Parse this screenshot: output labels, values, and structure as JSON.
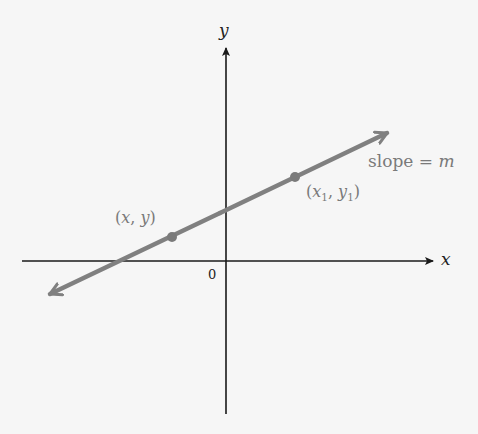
{
  "diagram": {
    "axes": {
      "x_label": "x",
      "y_label": "y",
      "origin_label": "0"
    },
    "line": {
      "slope_label_text": "slope = ",
      "slope_symbol": "m",
      "color": "#808080"
    },
    "points": [
      {
        "label_open": "(",
        "var_x": "x",
        "sep": ", ",
        "var_y": "y",
        "label_close": ")",
        "px": 172,
        "py": 237
      },
      {
        "label_open": "(",
        "var_x": "x",
        "sub_x": "1",
        "sep": ", ",
        "var_y": "y",
        "sub_y": "1",
        "label_close": ")",
        "px": 295,
        "py": 177
      }
    ],
    "colors": {
      "axis": "#1a1a1a",
      "line": "#808080",
      "label": "#7a7a7a",
      "background": "#f6f6f6"
    }
  }
}
